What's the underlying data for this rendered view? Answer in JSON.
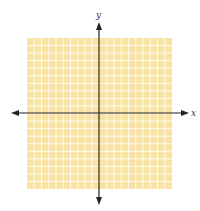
{
  "chart_data": {
    "type": "coordinate-grid",
    "title": "",
    "xlabel": "x",
    "ylabel": "y",
    "grid": true,
    "grid_cells_x": 20,
    "grid_cells_y": 20,
    "origin_cell": [
      10,
      10
    ],
    "tick_labels": [],
    "data_points": [],
    "axes_arrows": [
      "left",
      "right",
      "up",
      "down"
    ]
  },
  "colors": {
    "grid_fill": "#F8E3A3",
    "grid_lines": "#FFFFFF",
    "axis": "#222222",
    "label": "#333333"
  },
  "labels": {
    "x_axis": "x",
    "y_axis": "y"
  }
}
